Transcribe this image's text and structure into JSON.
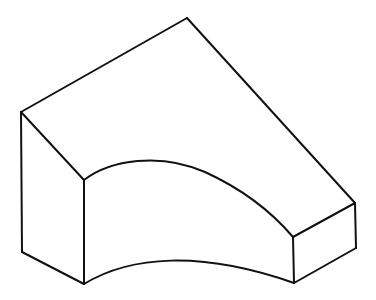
{
  "diagram": {
    "type": "isometric-solid",
    "colors": {
      "background": "#ffffff",
      "stroke": "#111111"
    },
    "vertices": {
      "apex": [
        187,
        18
      ],
      "left_top": [
        21,
        112
      ],
      "left_bottom": [
        22,
        252
      ],
      "front_left_top": [
        84,
        180
      ],
      "front_left_bottom": [
        84,
        284
      ],
      "right_top": [
        355,
        203
      ],
      "right_bottom": [
        356,
        248
      ],
      "front_right_top": [
        293,
        237
      ],
      "front_right_bottom": [
        294,
        283
      ]
    }
  }
}
